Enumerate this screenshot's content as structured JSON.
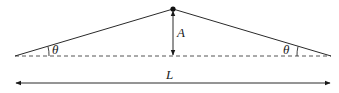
{
  "diagram": {
    "labels": {
      "amplitude": "A",
      "angle_left": "θ",
      "angle_right": "θ",
      "length": "L"
    },
    "colors": {
      "line": "#2a2a2a",
      "dashed": "#555555",
      "background": "#ffffff"
    }
  }
}
